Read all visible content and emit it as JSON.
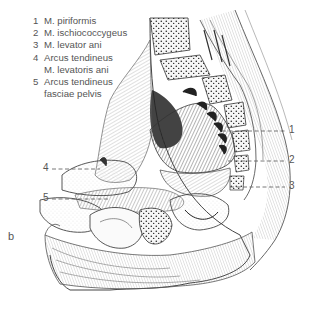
{
  "legend": {
    "items": [
      {
        "num": "1",
        "lines": [
          "M. piriformis"
        ]
      },
      {
        "num": "2",
        "lines": [
          "M. ischiococcygeus"
        ]
      },
      {
        "num": "3",
        "lines": [
          "M. levator ani"
        ]
      },
      {
        "num": "4",
        "lines": [
          "Arcus tendineus",
          "M. levatoris ani"
        ]
      },
      {
        "num": "5",
        "lines": [
          "Arcus tendineus",
          "fasciae pelvis"
        ]
      }
    ]
  },
  "callouts": [
    {
      "num": "1",
      "side": "right"
    },
    {
      "num": "2",
      "side": "right"
    },
    {
      "num": "3",
      "side": "right"
    },
    {
      "num": "4",
      "side": "left"
    },
    {
      "num": "5",
      "side": "left"
    }
  ],
  "panel_letter": "b",
  "colors": {
    "ink": "#333333",
    "label": "#555555",
    "bone_fill": "#f4f4f4",
    "muscle_dark": "#2a2a2a",
    "background": "#ffffff"
  }
}
